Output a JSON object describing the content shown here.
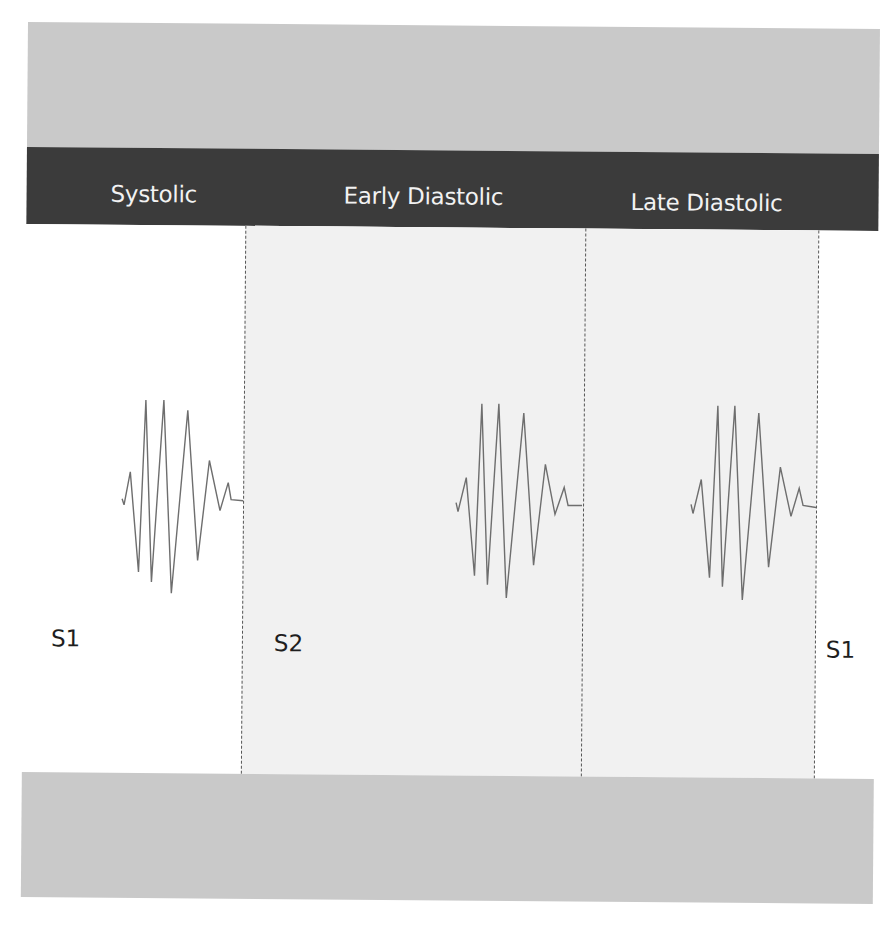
{
  "header": {
    "phases": [
      {
        "label": "Systolic"
      },
      {
        "label": "Early Diastolic"
      },
      {
        "label": "Late Diastolic"
      }
    ]
  },
  "sounds": {
    "labels": [
      {
        "label": "S1"
      },
      {
        "label": "S2"
      },
      {
        "label": "S1"
      }
    ]
  },
  "colors": {
    "panel_gray": "#c9c9c9",
    "header_dark": "#3b3b3b",
    "diastolic_shade": "#f1f1f1",
    "waveform": "#6e6e6e",
    "divider": "#555555"
  },
  "waveforms": [
    {
      "name": "systolic-murmur",
      "phase": "Systolic"
    },
    {
      "name": "early-diastolic-murmur",
      "phase": "Early Diastolic"
    },
    {
      "name": "late-diastolic-murmur",
      "phase": "Late Diastolic"
    }
  ]
}
